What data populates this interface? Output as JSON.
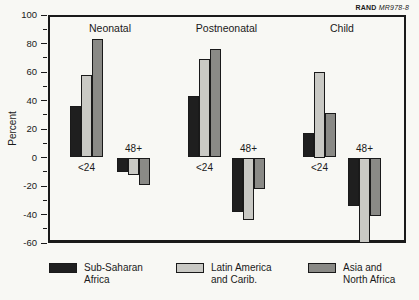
{
  "header": {
    "brand": "RAND",
    "doc_id": "MR978-8"
  },
  "colors": {
    "sub_saharan_africa": "#1f1f1f",
    "latin_america": "#c9c9c4",
    "asia_north_africa": "#8a8a86",
    "frame": "#1a1a1a",
    "background": "#f8f8f4"
  },
  "chart_data": {
    "type": "bar",
    "title": "",
    "ylabel": "Percent",
    "ylim": [
      -60,
      100
    ],
    "ytick_step": 20,
    "yminor_step": 10,
    "grid": false,
    "ytick_labels": [
      "100",
      "80",
      "60",
      "40",
      "20",
      "0",
      "-20",
      "-40",
      "-60"
    ],
    "series": [
      {
        "name": "Sub-Saharan Africa",
        "color": "#1f1f1f"
      },
      {
        "name": "Latin America and Carib.",
        "color": "#c9c9c4"
      },
      {
        "name": "Asia and North Africa",
        "color": "#8a8a86"
      }
    ],
    "panels": [
      {
        "title": "Neonatal",
        "clusters": [
          {
            "label": "<24",
            "values": [
              36,
              58,
              83
            ]
          },
          {
            "label": "48+",
            "values": [
              -10,
              -12,
              -19
            ]
          }
        ]
      },
      {
        "title": "Postneonatal",
        "clusters": [
          {
            "label": "<24",
            "values": [
              43,
              69,
              76
            ]
          },
          {
            "label": "48+",
            "values": [
              -38,
              -44,
              -22
            ]
          }
        ]
      },
      {
        "title": "Child",
        "clusters": [
          {
            "label": "<24",
            "values": [
              17,
              60,
              31
            ]
          },
          {
            "label": "48+",
            "values": [
              -34,
              -60,
              -41
            ]
          }
        ]
      }
    ]
  },
  "legend": {
    "items": [
      {
        "lines": [
          "Sub-Saharan",
          "Africa"
        ]
      },
      {
        "lines": [
          "Latin America",
          "and Carib."
        ]
      },
      {
        "lines": [
          "Asia and",
          "North Africa"
        ]
      }
    ]
  }
}
